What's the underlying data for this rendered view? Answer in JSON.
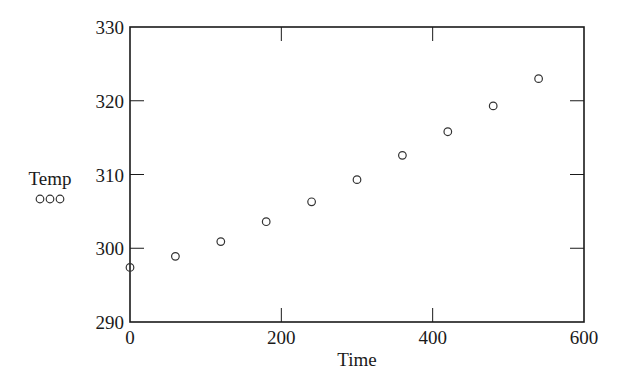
{
  "chart_data": {
    "type": "scatter",
    "title": "",
    "xlabel": "Time",
    "ylabel": "",
    "xlim": [
      0,
      600
    ],
    "ylim": [
      290,
      330
    ],
    "x_ticks": [
      0,
      200,
      400,
      600
    ],
    "y_ticks": [
      290,
      300,
      310,
      320,
      330
    ],
    "grid": false,
    "legend": {
      "position": "left",
      "entries": [
        {
          "label": "Temp",
          "marker": "ooo"
        }
      ]
    },
    "series": [
      {
        "name": "Temp",
        "marker": "open-circle",
        "x": [
          0,
          60,
          120,
          180,
          240,
          300,
          360,
          420,
          480,
          540
        ],
        "y": [
          297.4,
          298.9,
          300.9,
          303.6,
          306.3,
          309.3,
          312.6,
          315.8,
          319.3,
          323.0
        ]
      }
    ]
  },
  "legend": {
    "label": "Temp",
    "marker_text": "ooo"
  },
  "axes": {
    "xlabel": "Time",
    "x_tick_labels": [
      "0",
      "200",
      "400",
      "600"
    ],
    "y_tick_labels": [
      "290",
      "300",
      "310",
      "320",
      "330"
    ]
  },
  "colors": {
    "axis": "#1a1a1a",
    "marker": "#333333",
    "background": "#ffffff"
  }
}
